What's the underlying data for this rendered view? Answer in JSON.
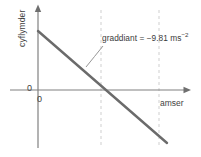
{
  "figure": {
    "kind": "velocity-time-graph",
    "language": "cy",
    "background_color": "#ffffff"
  },
  "axes": {
    "y_title": "cyflymder",
    "x_title": "amser",
    "origin_label_y": "0",
    "origin_label_x": "0",
    "axis_color": "#808080",
    "origin_px": {
      "x": 38,
      "y": 90
    },
    "y_axis_top_px": 6,
    "y_axis_bottom_px": 148,
    "x_axis_left_px": 10,
    "x_axis_right_px": 190
  },
  "annotation": {
    "prefix": "graddiant = ",
    "value": "−9.81",
    "unit_base": " ms",
    "unit_exponent": "−2",
    "full_text": "graddiant = −9.81 ms⁻²",
    "color": "#3a3a3a"
  },
  "series": {
    "name": "velocity",
    "color": "#6b6b6b",
    "width_px": 2.4,
    "start_px": {
      "x": 38,
      "y": 31
    },
    "end_px": {
      "x": 167,
      "y": 143
    },
    "x_intercept_px": 101
  },
  "guides": {
    "color": "#cfcfcf",
    "dash": "3 3",
    "lines_x_px": [
      101,
      159
    ],
    "top_px": 10,
    "bottom_px": 148
  },
  "leader": {
    "color": "#8a8a8a",
    "from_px": {
      "x": 103,
      "y": 46
    },
    "to_px": {
      "x": 86,
      "y": 67
    }
  },
  "chart_data": {
    "type": "line",
    "title": "",
    "subtitle": "",
    "xlabel": "amser",
    "ylabel": "cyflymder",
    "legend": [],
    "legend_position": "none",
    "grid": false,
    "annotations": [
      "graddiant = −9.81 ms⁻²"
    ],
    "xticklabels": [
      "0"
    ],
    "yticklabels": [
      "0"
    ],
    "xlim": [
      0,
      1
    ],
    "ylim": [
      -1,
      0.53
    ],
    "series": [
      {
        "name": "cyflymder",
        "slope": -9.81,
        "slope_units": "m s^-2",
        "x": [
          0,
          0.5,
          1.0
        ],
        "y": [
          0.53,
          0.0,
          -0.53
        ],
        "color": "#6b6b6b"
      }
    ],
    "reference_lines": [
      {
        "orientation": "vertical",
        "x": 0.5,
        "style": "dashed"
      },
      {
        "orientation": "vertical",
        "x": 0.95,
        "style": "dashed"
      }
    ]
  }
}
